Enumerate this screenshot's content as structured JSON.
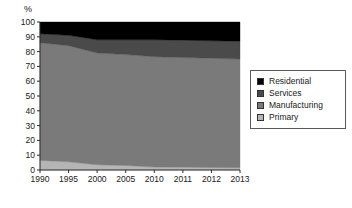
{
  "chart_data": {
    "type": "area",
    "title": "",
    "subtitle": "",
    "xlabel": "",
    "ylabel": "%",
    "ylim": [
      0,
      100
    ],
    "ytick_labels": [
      "100",
      "90",
      "80",
      "70",
      "60",
      "50",
      "40",
      "30",
      "20",
      "10",
      "0"
    ],
    "ytick_values": [
      100,
      90,
      80,
      70,
      60,
      50,
      40,
      30,
      20,
      10,
      0
    ],
    "grid": false,
    "stacked": true,
    "stack_total": 100,
    "legend_position": "right",
    "categories": [
      "1990",
      "1995",
      "2000",
      "2005",
      "2010",
      "2011",
      "2012",
      "2013"
    ],
    "series": [
      {
        "name": "Primary",
        "color": "#b5b5b5",
        "values": [
          6.5,
          5.5,
          3.5,
          3.0,
          2.0,
          1.9,
          1.7,
          1.5
        ]
      },
      {
        "name": "Manufacturing",
        "color": "#7a7a7a",
        "values": [
          79.5,
          78.5,
          75.5,
          75.0,
          74.5,
          74.1,
          73.8,
          73.5
        ]
      },
      {
        "name": "Services",
        "color": "#4a4a4a",
        "values": [
          6.0,
          7.0,
          9.0,
          10.0,
          11.5,
          11.7,
          11.8,
          12.0
        ]
      },
      {
        "name": "Residential",
        "color": "#000000",
        "values": [
          8.0,
          9.0,
          12.0,
          12.0,
          12.0,
          12.3,
          12.7,
          13.0
        ]
      }
    ],
    "cumulative_tops": {
      "primary": [
        6.5,
        5.5,
        3.5,
        3.0,
        2.0,
        1.9,
        1.7,
        1.5
      ],
      "manufacturing": [
        86.0,
        84.0,
        79.0,
        78.0,
        76.5,
        76.0,
        75.5,
        75.0
      ],
      "services": [
        92.0,
        91.0,
        88.0,
        88.0,
        88.0,
        87.7,
        87.3,
        87.0
      ],
      "residential": [
        100,
        100,
        100,
        100,
        100,
        100,
        100,
        100
      ]
    }
  },
  "legend": {
    "items": [
      {
        "label": "Residential",
        "color": "#000000"
      },
      {
        "label": "Services",
        "color": "#4a4a4a"
      },
      {
        "label": "Manufacturing",
        "color": "#7a7a7a"
      },
      {
        "label": "Primary",
        "color": "#b5b5b5"
      }
    ]
  }
}
